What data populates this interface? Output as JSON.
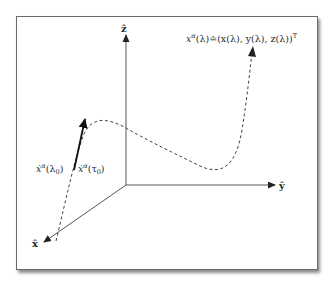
{
  "figure": {
    "type": "3d-axes-curve-diagram",
    "axes": {
      "z": {
        "label": "ẑ"
      },
      "y": {
        "label": "ŷ"
      },
      "x": {
        "label": "x̂"
      }
    },
    "curve": {
      "label_lhs": "x",
      "label_sup": "α",
      "label_rest": "(λ)≐(x(λ), y(λ), z(λ))",
      "label_transpose": "T",
      "style": "dashed"
    },
    "tangent": {
      "label_left_base": "ẋ",
      "label_left_sup": "α",
      "label_left_arg": "(λ",
      "label_left_sub": "0",
      "label_left_close": ")",
      "label_right_base": "ẋ",
      "label_right_sup": "α",
      "label_right_arg": "(τ",
      "label_right_sub": "0",
      "label_right_close": ")",
      "style": "solid"
    },
    "colors": {
      "stroke": "#333333",
      "frame": "#6a6a6a",
      "background": "#ffffff"
    }
  }
}
